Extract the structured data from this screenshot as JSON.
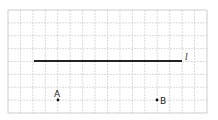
{
  "diagram": {
    "grid": {
      "x0": 8,
      "y0": 10,
      "x1": 207,
      "y1": 113,
      "cols": 16,
      "rows": 8,
      "line_color": "#d0d0d0",
      "border_color": "#c0c0c0"
    },
    "line": {
      "x1": 34,
      "y1": 61,
      "x2": 182,
      "y2": 61,
      "label": "l",
      "color": "#222222"
    },
    "points": [
      {
        "name": "A",
        "x": 58,
        "y": 100
      },
      {
        "name": "B",
        "x": 157,
        "y": 100
      }
    ]
  }
}
